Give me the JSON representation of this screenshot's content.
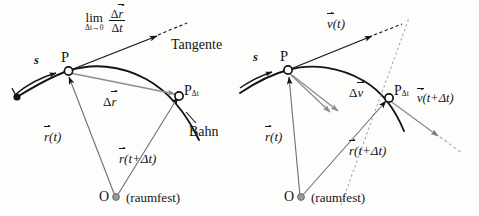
{
  "figure": {
    "colors": {
      "ink": "#141414",
      "gray_vector": "#8c8c8c",
      "gray_dotted": "#a8a8a8",
      "origin_dot": "#9a9a9a",
      "background": "#fdfdfc"
    }
  },
  "left_panel": {
    "name": "position-derivative-panel",
    "limit_expression": {
      "operator": "lim",
      "subscript": "Δt→0",
      "numerator_delta": "Δ",
      "numerator_vector": "r",
      "denominator_delta": "Δ",
      "denominator_var": "t"
    },
    "labels": {
      "tangente": "Tangente",
      "bahn": "Bahn",
      "arc_length": "s",
      "point_p": "P",
      "point_pdt_base": "P",
      "point_pdt_sub": "Δt",
      "origin": "O",
      "origin_note": "(raumfest)",
      "delta_r_delta": "Δ",
      "delta_r_vector": "r",
      "r_of_t_vector": "r",
      "r_of_t_arg": "(t)",
      "r_of_tdt_vector": "r",
      "r_of_tdt_arg": "(t+Δt)"
    }
  },
  "right_panel": {
    "name": "velocity-derivative-panel",
    "labels": {
      "v_of_t_vector": "v",
      "v_of_t_arg": "(t)",
      "v_of_tdt_vector": "v",
      "v_of_tdt_arg": "(t+Δt)",
      "delta_v_delta": "Δ",
      "delta_v_vector": "v",
      "arc_length": "s",
      "point_p": "P",
      "point_pdt_base": "P",
      "point_pdt_sub": "Δt",
      "origin": "O",
      "origin_note": "(raumfest)",
      "r_of_t_vector": "r",
      "r_of_t_arg": "(t)",
      "r_of_tdt_vector": "r",
      "r_of_tdt_arg": "(t+Δt)"
    }
  }
}
